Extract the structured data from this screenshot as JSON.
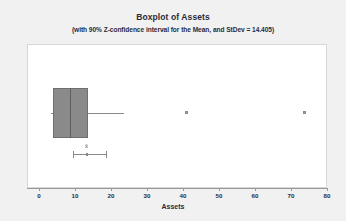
{
  "chart_data": {
    "type": "boxplot",
    "title": "Boxplot of Assets",
    "subtitle": "(with 90% Z-confidence interval for the Mean, and StDev = 14.405)",
    "xlabel": "Assets",
    "ylabel": "",
    "xlim": [
      0,
      80
    ],
    "xticks": [
      0,
      10,
      20,
      30,
      40,
      50,
      60,
      70,
      80
    ],
    "xtick_labels": [
      "0",
      "10",
      "20",
      "30",
      "40",
      "50",
      "60",
      "70",
      "80"
    ],
    "grid": false,
    "legend": "none",
    "orientation": "horizontal",
    "stdev": 14.405,
    "confidence_level": "90%",
    "confidence_type": "Z-confidence interval for the Mean",
    "box": {
      "whisker_low": 3.2,
      "q1": 3.9,
      "median": 8.5,
      "q3": 13.5,
      "whisker_high": 23.5
    },
    "outliers": [
      41.0,
      74.0
    ],
    "mean_interval": {
      "symbol": "x̄",
      "lower": 9.5,
      "center": 13.3,
      "upper": 18.6
    },
    "colors": {
      "box_fill": "#8a8a8a",
      "box_edge": "#6f6f6f",
      "median_line": "#5e5e5e",
      "whisker": "#8a8a8a",
      "outlier": "#9a9a9a",
      "axis": "#9a9a9a",
      "text": "#2b2b3b",
      "plot_background": "#ffffff",
      "figure_background": "#f1f1f1"
    }
  }
}
